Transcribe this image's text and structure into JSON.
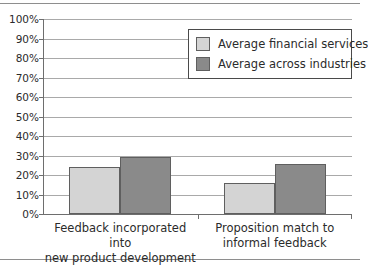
{
  "chart_data": {
    "type": "bar",
    "title": "",
    "xlabel": "",
    "ylabel": "",
    "ylim": [
      0,
      100
    ],
    "ytick_step": 10,
    "grid": true,
    "legend_position": "upper-right",
    "categories": [
      "Feedback incorporated into new product development",
      "Proposition match to informal feedback"
    ],
    "category_lines": [
      [
        "Feedback incorporated into",
        "new product development"
      ],
      [
        "Proposition match to",
        "informal feedback"
      ]
    ],
    "ytick_labels": [
      "100%",
      "90%",
      "80%",
      "70%",
      "60%",
      "50%",
      "40%",
      "30%",
      "20%",
      "10%",
      "0%"
    ],
    "ytick_values": [
      100,
      90,
      80,
      70,
      60,
      50,
      40,
      30,
      20,
      10,
      0
    ],
    "series": [
      {
        "name": "Average financial services",
        "color": "#d4d4d4",
        "values": [
          24,
          16
        ]
      },
      {
        "name": "Average across industries",
        "color": "#8a8a8a",
        "values": [
          29,
          25.5
        ]
      }
    ]
  },
  "legend": {
    "items": [
      {
        "label": "Average financial services"
      },
      {
        "label": "Average across industries"
      }
    ]
  },
  "colors": {
    "series_light": "#d4d4d4",
    "series_dark": "#8a8a8a",
    "bar_edge": "#5f5f5f",
    "gridline": "#a9a9a9",
    "axis": "#6e6e6e",
    "frame": "#8e8e8e",
    "text": "#2b2b2b"
  }
}
